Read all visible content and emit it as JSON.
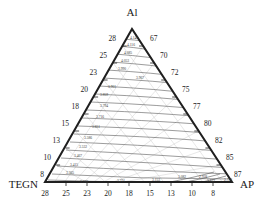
{
  "figure": {
    "type": "ternary-contour-diagram",
    "background_color": "#ffffff",
    "line_color": "#2b2b2b",
    "contour_color": "#555555",
    "grid_color": "#b9b9b9"
  },
  "corners": {
    "top": "Al",
    "bottom_left": "TEGN",
    "bottom_right": "AP"
  },
  "axes": {
    "left": {
      "name": "left-axis",
      "ticks": [
        "28",
        "25",
        "23",
        "20",
        "18",
        "15",
        "13",
        "10",
        "8"
      ]
    },
    "right": {
      "name": "right-axis",
      "ticks": [
        "67",
        "70",
        "72",
        "75",
        "77",
        "80",
        "82",
        "85",
        "87"
      ]
    },
    "bottom": {
      "name": "bottom-axis",
      "ticks": [
        "28",
        "25",
        "23",
        "20",
        "18",
        "15",
        "13",
        "10",
        "8"
      ]
    }
  },
  "chart_data": {
    "type": "contour",
    "title": "",
    "xlabel": "",
    "ylabel": "",
    "ternary_vertices": [
      "Al",
      "TEGN",
      "AP"
    ],
    "axis_left_ticks": [
      28,
      25,
      23,
      20,
      18,
      15,
      13,
      10,
      8
    ],
    "axis_right_ticks": [
      67,
      70,
      72,
      75,
      77,
      80,
      82,
      85,
      87
    ],
    "axis_bottom_ticks": [
      28,
      25,
      23,
      20,
      18,
      15,
      13,
      10,
      8
    ],
    "contour_levels": [
      "4.148",
      "4.116",
      "4.085",
      "4.053",
      "3.990",
      "3.967",
      "3.901",
      "3.859",
      "3.794",
      "3.716",
      "3.651",
      "3.586",
      "3.532",
      "3.467",
      "3.415",
      "3.365",
      "3.288",
      "3.221",
      "3.153",
      "3.082",
      "2.928",
      "2.842",
      "2.728"
    ],
    "grid": true,
    "legend": "none"
  },
  "contour_labels": [
    {
      "text": "4.148",
      "x": 134,
      "y": 39
    },
    {
      "text": "4.116",
      "x": 131,
      "y": 46
    },
    {
      "text": "4.085",
      "x": 128,
      "y": 54
    },
    {
      "text": "4.053",
      "x": 125,
      "y": 62
    },
    {
      "text": "3.990",
      "x": 122,
      "y": 70
    },
    {
      "text": "3.967",
      "x": 140,
      "y": 79
    },
    {
      "text": "3.901",
      "x": 112,
      "y": 88
    },
    {
      "text": "3.859",
      "x": 104,
      "y": 96
    },
    {
      "text": "3.794",
      "x": 104,
      "y": 107
    },
    {
      "text": "3.716",
      "x": 100,
      "y": 118
    },
    {
      "text": "3.651",
      "x": 96,
      "y": 128
    },
    {
      "text": "3.586",
      "x": 88,
      "y": 139
    },
    {
      "text": "3.532",
      "x": 83,
      "y": 148
    },
    {
      "text": "3.467",
      "x": 78,
      "y": 157
    },
    {
      "text": "3.415",
      "x": 74,
      "y": 166
    },
    {
      "text": "3.365",
      "x": 70,
      "y": 174
    },
    {
      "text": "3.288",
      "x": 84,
      "y": 183
    },
    {
      "text": "3.221",
      "x": 121,
      "y": 182
    },
    {
      "text": "3.153",
      "x": 156,
      "y": 181
    },
    {
      "text": "3.082",
      "x": 182,
      "y": 178
    },
    {
      "text": "2.928",
      "x": 203,
      "y": 178
    },
    {
      "text": "2.842",
      "x": 211,
      "y": 182
    },
    {
      "text": "2.728",
      "x": 228,
      "y": 181
    }
  ]
}
